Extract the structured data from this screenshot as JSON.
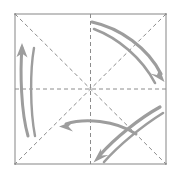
{
  "figure": {
    "type": "origami-step-diagram",
    "canvas": {
      "width": 177,
      "height": 174,
      "background": "#ffffff"
    }
  },
  "colors": {
    "paper_edge": "#9a9a9a",
    "fold_line": "#8c8c8c",
    "arrow": "#9d9d9d",
    "background": "#ffffff"
  },
  "paper": {
    "shape": "square",
    "left": 15,
    "top": 14,
    "right": 166,
    "bottom": 164,
    "stroke_width": 1.2
  },
  "fold_lines": [
    {
      "name": "vertical-crease",
      "style": "dashed",
      "x1": 90.5,
      "y1": 14,
      "x2": 90.5,
      "y2": 164
    },
    {
      "name": "horizontal-crease",
      "style": "dashed",
      "x1": 15,
      "y1": 89,
      "x2": 166,
      "y2": 89
    },
    {
      "name": "diagonal-crease-tlbr",
      "style": "dashed",
      "x1": 15,
      "y1": 14,
      "x2": 166,
      "y2": 164
    },
    {
      "name": "diagonal-crease-trbl",
      "style": "dashed",
      "x1": 166,
      "y1": 14,
      "x2": 15,
      "y2": 164
    }
  ],
  "arrows": [
    {
      "name": "left-up-arrow",
      "direction": "up",
      "path": "M 28 136 C 21 112 20 72 22 48",
      "head": {
        "x": 22,
        "y": 45,
        "angle": -86
      },
      "width": 3.0
    },
    {
      "name": "left-companion-curve",
      "direction": "up",
      "has_head": false,
      "path": "M 35 136 C 30 110 30 70 34 48",
      "width": 2.4
    },
    {
      "name": "upper-right-down-arrow",
      "direction": "down-right",
      "path": "M 92 22 C 120 28 148 48 161 74",
      "head": {
        "x": 163,
        "y": 78,
        "angle": 62
      },
      "width": 3.2
    },
    {
      "name": "upper-right-companion-curve",
      "direction": "down-right",
      "has_head": false,
      "path": "M 94 29 C 118 38 142 58 155 83",
      "width": 2.6
    },
    {
      "name": "lower-left-arrow",
      "direction": "left",
      "path": "M 136 134 C 115 120 84 118 66 124",
      "head": {
        "x": 62,
        "y": 126,
        "angle": 186
      },
      "width": 3.0
    },
    {
      "name": "lower-right-down-left-arrow",
      "direction": "down-left",
      "path": "M 160 107 C 140 118 115 138 100 155",
      "head": {
        "x": 97,
        "y": 159,
        "angle": 228
      },
      "width": 3.2
    },
    {
      "name": "lower-right-companion-curve",
      "direction": "down-left",
      "has_head": false,
      "path": "M 163 113 C 142 126 118 146 104 162",
      "width": 2.6
    }
  ]
}
